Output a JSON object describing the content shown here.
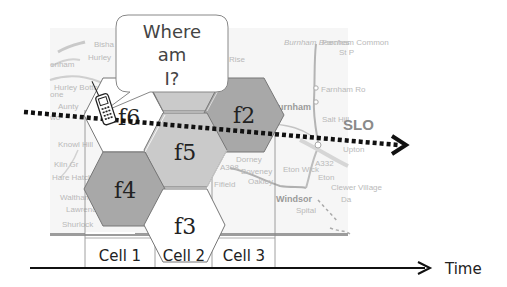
{
  "diagram": {
    "speech_bubble": {
      "line1": "Where",
      "line2": "am",
      "line3": "I?"
    },
    "hexagons": [
      {
        "id": "f6",
        "label": "f6",
        "fill": "#ffffff"
      },
      {
        "id": "top",
        "label": "",
        "fill": "#c8c8c8"
      },
      {
        "id": "f2",
        "label": "f2",
        "fill": "#a6a6a6"
      },
      {
        "id": "f5",
        "label": "f5",
        "fill": "#c8c8c8"
      },
      {
        "id": "f4",
        "label": "f4",
        "fill": "#a6a6a6"
      },
      {
        "id": "f3",
        "label": "f3",
        "fill": "#ffffff"
      }
    ],
    "cells": [
      {
        "label": "Cell 1"
      },
      {
        "label": "Cell 2"
      },
      {
        "label": "Cell 3"
      }
    ],
    "time_axis": {
      "label": "Time"
    },
    "phone_icon": "mobile-phone-icon",
    "trajectory": "dotted-arrow",
    "map_labels": {
      "bisham": "Bisha",
      "hurley": "Hurley",
      "nham": "enham",
      "hurley_bottom": "Hurley Bottom",
      "stone": "one",
      "aunty": "Aunty",
      "burchetts": "Burchett's",
      "two": "wo",
      "maidenhead": "AIDENH",
      "knowl_hill": "Knowl Hill",
      "littlewick": "ittlewick",
      "kiln_green": "Kiln Gr",
      "hare_hatch": "Hare Hatch",
      "waltham": "Waltham",
      "lawrence": "Lawrence",
      "shurlock": "Shurlock",
      "rise": "Rise",
      "burnham_beeches": "Burnham Beeches",
      "farnham_common": "Farnham Common",
      "st_p": "St P",
      "farnham_ro": "Farnham Ro",
      "burnham": "urnham",
      "salt_hill": "Salt Hill",
      "slough": "SLO",
      "dorney": "Dorney",
      "boveney": "Boveney",
      "oakley": "Oakley",
      "fifield": "Fifield",
      "eton_wick": "Eton Wick",
      "eton": "Eton",
      "clewer_village": "Clewer Village",
      "windsor": "Windsor",
      "spital": "Spital",
      "da": "Da",
      "upton": "Upton",
      "a332": "A332",
      "a308": "A308"
    }
  }
}
